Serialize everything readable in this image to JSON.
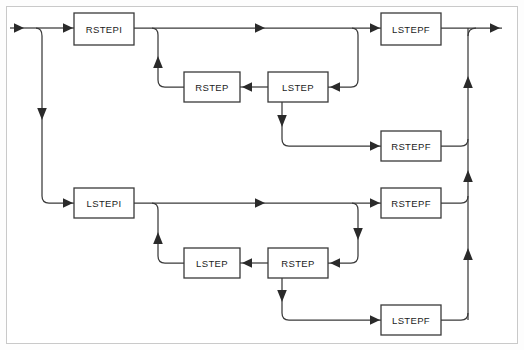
{
  "diagram": {
    "colors": {
      "background": "#fdfdfd",
      "frame_border": "#c9c9c9",
      "box_stroke": "#3a3a3a",
      "box_fill": "#ffffff",
      "edge": "#3a3a3a",
      "arrow": "#2a2a2a",
      "label": "#1c1c1c"
    },
    "frame": {
      "x": 6,
      "y": 6,
      "width": 512,
      "height": 338
    },
    "nodes": [
      {
        "id": "rstepi",
        "label": "RSTEPI",
        "x": 74,
        "y": 13,
        "width": 60,
        "height": 32
      },
      {
        "id": "rstep_top",
        "label": "RSTEP",
        "x": 184,
        "y": 72,
        "width": 56,
        "height": 30
      },
      {
        "id": "lstep_top",
        "label": "LSTEP",
        "x": 268,
        "y": 72,
        "width": 60,
        "height": 30
      },
      {
        "id": "lstepf_top",
        "label": "LSTEPF",
        "x": 381,
        "y": 13,
        "width": 60,
        "height": 32
      },
      {
        "id": "rstepf_upper",
        "label": "RSTEPF",
        "x": 381,
        "y": 131,
        "width": 60,
        "height": 30
      },
      {
        "id": "lstepi",
        "label": "LSTEPI",
        "x": 74,
        "y": 188,
        "width": 60,
        "height": 30
      },
      {
        "id": "lstep_bot",
        "label": "LSTEP",
        "x": 184,
        "y": 248,
        "width": 56,
        "height": 30
      },
      {
        "id": "rstep_bot",
        "label": "RSTEP",
        "x": 268,
        "y": 248,
        "width": 60,
        "height": 30
      },
      {
        "id": "rstepf_lower",
        "label": "RSTEPF",
        "x": 381,
        "y": 188,
        "width": 60,
        "height": 30
      },
      {
        "id": "lstepf_bot",
        "label": "LSTEPF",
        "x": 381,
        "y": 305,
        "width": 60,
        "height": 30
      }
    ],
    "edges": [
      {
        "id": "entry-to-split",
        "from": "input",
        "to": "split-left",
        "direction": "right"
      },
      {
        "id": "split-to-rstepi",
        "from": "split-left",
        "to": "rstepi",
        "direction": "right"
      },
      {
        "id": "split-down-to-lstepi",
        "from": "split-left",
        "to": "lstepi",
        "direction": "down"
      },
      {
        "id": "rstepi-to-lstepf",
        "from": "rstepi",
        "to": "lstepf_top",
        "direction": "right"
      },
      {
        "id": "rstepi-branch-to-rstep",
        "from": "rstepi",
        "to": "rstep_top",
        "direction": "down-left"
      },
      {
        "id": "rstep-to-lstep-return",
        "from": "rstep_top",
        "to": "lstep_top",
        "direction": "left"
      },
      {
        "id": "lstepf-branch-to-lstep",
        "from": "lstepf_top",
        "to": "lstep_top",
        "direction": "down-left"
      },
      {
        "id": "lstep-to-rstepf-upper",
        "from": "lstep_top",
        "to": "rstepf_upper",
        "direction": "down-right"
      },
      {
        "id": "lstepf-to-right-rail",
        "from": "lstepf_top",
        "to": "output",
        "direction": "right"
      },
      {
        "id": "rstepf-upper-to-rail",
        "from": "rstepf_upper",
        "to": "right-rail",
        "direction": "right-up"
      },
      {
        "id": "lstepi-to-rstepf-lower",
        "from": "lstepi",
        "to": "rstepf_lower",
        "direction": "right"
      },
      {
        "id": "lstepi-branch-to-lstep",
        "from": "lstepi",
        "to": "lstep_bot",
        "direction": "down-left"
      },
      {
        "id": "lstep-to-rstep-return",
        "from": "lstep_bot",
        "to": "rstep_bot",
        "direction": "left"
      },
      {
        "id": "rstepf-branch-to-rstep",
        "from": "rstepf_lower",
        "to": "rstep_bot",
        "direction": "down-left"
      },
      {
        "id": "rstep-to-lstepf-bot",
        "from": "rstep_bot",
        "to": "lstepf_bot",
        "direction": "down-right"
      },
      {
        "id": "rstepf-lower-to-rail",
        "from": "rstepf_lower",
        "to": "right-rail",
        "direction": "right-up"
      },
      {
        "id": "lstepf-bot-to-rail",
        "from": "lstepf_bot",
        "to": "right-rail",
        "direction": "right-up"
      },
      {
        "id": "rail-to-output",
        "from": "right-rail",
        "to": "output",
        "direction": "up-right"
      }
    ],
    "ports": {
      "input_arrow_x": 22,
      "input_y": 28,
      "output_arrow_x": 502,
      "left_rail_x": 42,
      "right_rail_x": 468
    }
  }
}
